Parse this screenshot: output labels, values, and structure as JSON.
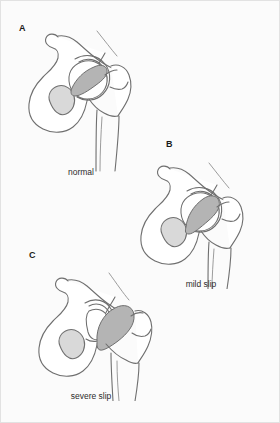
{
  "figure": {
    "background_color": "#fbfbfb",
    "border_color": "#e2e2e2",
    "outline_color": "#6f6f6f",
    "epiphysis_color": "#b4b4b4",
    "foramen_color": "#d9d9d9",
    "width": 280,
    "height": 423
  },
  "panels": [
    {
      "letter": "A",
      "caption": "normal",
      "icon": "hip-joint-normal-icon"
    },
    {
      "letter": "B",
      "caption": "mild slip",
      "icon": "hip-joint-mild-slip-icon"
    },
    {
      "letter": "C",
      "caption": "severe slip",
      "icon": "hip-joint-severe-slip-icon"
    }
  ]
}
